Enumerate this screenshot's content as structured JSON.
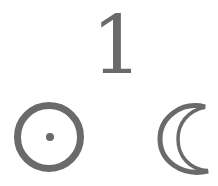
{
  "numeral": {
    "text": "1"
  },
  "symbols": [
    {
      "name": "sun",
      "icon": "sun-icon",
      "glyph": "☉"
    },
    {
      "name": "moon",
      "icon": "crescent-moon-icon",
      "glyph": "☾"
    }
  ],
  "colors": {
    "ink": "#6a6a6a",
    "background": "#ffffff"
  }
}
